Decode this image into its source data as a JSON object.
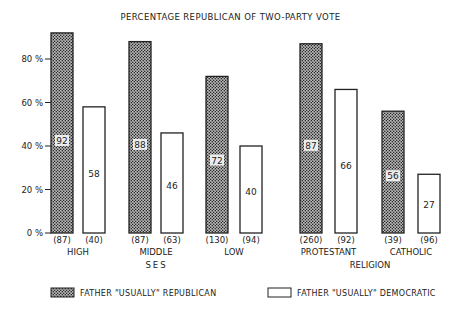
{
  "title": "PERCENTAGE REPUBLICAN OF TWO-PARTY VOTE",
  "chart_data": {
    "type": "bar",
    "title": "PERCENTAGE REPUBLICAN OF TWO-PARTY VOTE",
    "xlabel": "",
    "ylabel": "",
    "ylim": [
      0,
      80
    ],
    "y_ticks": [
      "0%",
      "20%",
      "40%",
      "60%",
      "80%"
    ],
    "groups": [
      {
        "name": "SES",
        "categories": [
          "HIGH",
          "MIDDLE",
          "LOW"
        ]
      },
      {
        "name": "RELIGION",
        "categories": [
          "PROTESTANT",
          "CATHOLIC"
        ]
      }
    ],
    "categories": [
      "HIGH",
      "MIDDLE",
      "LOW",
      "PROTESTANT",
      "CATHOLIC"
    ],
    "series": [
      {
        "name": "FATHER \"USUALLY\" REPUBLICAN",
        "values": [
          92,
          88,
          72,
          87,
          56
        ],
        "n": [
          "(87)",
          "(87)",
          "(130)",
          "(260)",
          "(39)"
        ],
        "fill": "hatched"
      },
      {
        "name": "FATHER \"USUALLY\" DEMOCRATIC",
        "values": [
          58,
          46,
          40,
          66,
          27
        ],
        "n": [
          "(40)",
          "(63)",
          "(94)",
          "(92)",
          "(96)"
        ],
        "fill": "white"
      }
    ],
    "grid": false,
    "legend_position": "bottom"
  },
  "legend": {
    "republican": "FATHER \"USUALLY\" REPUBLICAN",
    "democratic": "FATHER \"USUALLY\" DEMOCRATIC"
  }
}
